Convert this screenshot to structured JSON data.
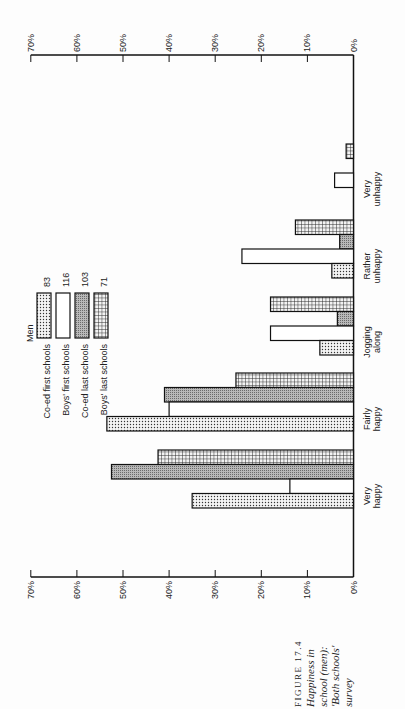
{
  "chart_data": {
    "type": "bar",
    "orientation": "rotated (figure printed sideways; bars horizontal in page pixels, vertical when read)",
    "xlabel": "",
    "ylabel": "",
    "ylim": [
      0,
      70
    ],
    "y_ticks": [
      "0%",
      "10%",
      "20%",
      "30%",
      "40%",
      "50%",
      "60%",
      "70%"
    ],
    "grid": false,
    "legend_title": "Men",
    "legend_position": "top-left (when read upright)",
    "categories": [
      "Very happy",
      "Fairly happy",
      "Jogging along",
      "Rather unhappy",
      "Very unhappy"
    ],
    "category_lines": [
      [
        "Very",
        "happy"
      ],
      [
        "Fairly",
        "happy"
      ],
      [
        "Jogging",
        "along"
      ],
      [
        "Rather",
        "unhappy"
      ],
      [
        "Very",
        "unhappy"
      ]
    ],
    "series": [
      {
        "name": "Co-ed first schools",
        "n": "83",
        "pattern": "dots",
        "values": [
          35,
          53.5,
          7.3,
          4.7,
          0
        ]
      },
      {
        "name": "Boys' first schools",
        "n": "116",
        "pattern": "white",
        "values": [
          13.8,
          40,
          18,
          24.2,
          4.1
        ]
      },
      {
        "name": "Co-ed last schools",
        "n": "103",
        "pattern": "grey",
        "values": [
          52.5,
          41,
          3.5,
          3,
          0
        ]
      },
      {
        "name": "Boys' last schools",
        "n": "71",
        "pattern": "grid",
        "values": [
          42.4,
          25.5,
          18,
          12.6,
          1.6
        ]
      }
    ]
  },
  "legend": {
    "title": "Men",
    "items": [
      {
        "label": "Co-ed first schools",
        "n": "83"
      },
      {
        "label": "Boys' first schools",
        "n": "116"
      },
      {
        "label": "Co-ed last schools",
        "n": "103"
      },
      {
        "label": "Boys' last schools",
        "n": "71"
      }
    ]
  },
  "caption": {
    "figure": "FIGURE 17.4",
    "lines": [
      "Happiness in",
      "school (men):",
      "'Both schools'",
      "survey"
    ]
  }
}
